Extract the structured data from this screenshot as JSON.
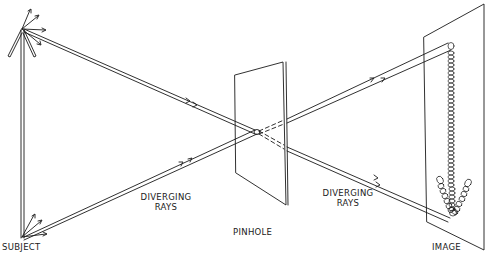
{
  "diagram": {
    "labels": {
      "subject": "SUBJECT",
      "diverging_rays_left_line1": "DIVERGING",
      "diverging_rays_left_line2": "RAYS",
      "pinhole": "PINHOLE",
      "diverging_rays_right_line1": "DIVERGING",
      "diverging_rays_right_line2": "RAYS",
      "image": "IMAGE"
    },
    "colors": {
      "line": "#1a1a1a",
      "background": "#ffffff"
    }
  }
}
